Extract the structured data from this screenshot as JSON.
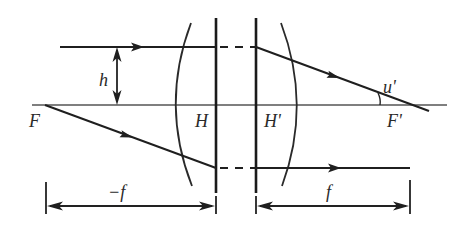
{
  "diagram": {
    "type": "thick-lens-principal-planes",
    "labels": {
      "front_focus": "F",
      "back_focus": "F'",
      "front_principal_plane": "H",
      "back_principal_plane": "H'",
      "ray_height": "h",
      "image_angle": "u'",
      "front_focal_length": "−f",
      "back_focal_length": "f"
    },
    "colors": {
      "line": "#1f1f1f",
      "axis": "#555555",
      "background": "#ffffff"
    }
  }
}
